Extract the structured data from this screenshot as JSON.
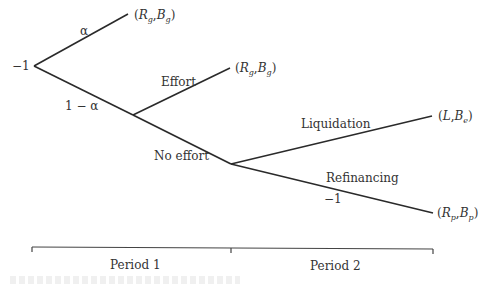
{
  "diagram": {
    "type": "decision-tree",
    "nodes": [
      {
        "id": "root",
        "x": 34,
        "y": 66,
        "label": "−1"
      },
      {
        "id": "n_bad",
        "x": 133,
        "y": 115
      },
      {
        "id": "n_noeffort",
        "x": 231,
        "y": 164
      }
    ],
    "edges": [
      {
        "from": "root",
        "to": "leaf_good",
        "label": "α"
      },
      {
        "from": "root",
        "to": "n_bad",
        "label": "1 − α"
      },
      {
        "from": "n_bad",
        "to": "leaf_effort",
        "label": "Effort"
      },
      {
        "from": "n_bad",
        "to": "n_noeffort",
        "label": "No effort"
      },
      {
        "from": "n_noeffort",
        "to": "leaf_liq",
        "label": "Liquidation"
      },
      {
        "from": "n_noeffort",
        "to": "leaf_ref",
        "label": "Refinancing",
        "sublabel": "−1"
      }
    ],
    "root_label": "−1",
    "branch_labels": {
      "alpha": "α",
      "one_minus_alpha": "1 − α",
      "effort": "Effort",
      "no_effort": "No effort",
      "liquidation": "Liquidation",
      "refinancing": "Refinancing",
      "refinancing_cost": "−1"
    },
    "payoffs": {
      "good": {
        "open": "(",
        "a": "R",
        "a_sub": "g",
        "sep": ",",
        "b": "B",
        "b_sub": "g",
        "close": ")"
      },
      "effort": {
        "open": "(",
        "a": "R",
        "a_sub": "g",
        "sep": ",",
        "b": "B",
        "b_sub": "g",
        "close": ")"
      },
      "liquidation": {
        "open": "(",
        "a": "L",
        "a_sub": "",
        "sep": ",",
        "b": "B",
        "b_sub": "e",
        "close": ")"
      },
      "refinancing": {
        "open": "(",
        "a": "R",
        "a_sub": "p",
        "sep": ",",
        "b": "B",
        "b_sub": "p",
        "close": ")"
      }
    }
  },
  "timeline": {
    "periods": [
      {
        "label": "Period 1"
      },
      {
        "label": "Period 2"
      }
    ]
  }
}
